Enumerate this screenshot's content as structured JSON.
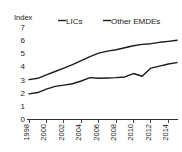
{
  "chart_data": {
    "type": "line",
    "title": "",
    "subtitle": "",
    "unit_label": "Index",
    "xlabel": "",
    "ylabel": "",
    "ylim": [
      0,
      7
    ],
    "yticks": [
      "0",
      "1",
      "2",
      "3",
      "4",
      "5",
      "6",
      "7"
    ],
    "ytick_values": [
      0,
      1,
      2,
      3,
      4,
      5,
      6,
      7
    ],
    "xlim": [
      1998,
      2015
    ],
    "xticks": [
      "1998",
      "2000",
      "2002",
      "2004",
      "2006",
      "2008",
      "2010",
      "2012",
      "2014"
    ],
    "xtick_values": [
      1998,
      2000,
      2002,
      2004,
      2006,
      2008,
      2010,
      2012,
      2014
    ],
    "x": [
      1998,
      1999,
      2000,
      2001,
      2002,
      2003,
      2004,
      2005,
      2006,
      2007,
      2008,
      2009,
      2010,
      2011,
      2012,
      2013,
      2014,
      2015
    ],
    "grid": false,
    "legend_position": "top",
    "series": [
      {
        "name": "LICs",
        "color": "#1a1a1a",
        "values": [
          1.85,
          1.95,
          2.2,
          2.4,
          2.5,
          2.6,
          2.8,
          3.05,
          3.0,
          3.02,
          3.05,
          3.1,
          3.35,
          3.15,
          3.75,
          3.9,
          4.05,
          4.15
        ]
      },
      {
        "name": "Other EMDEs",
        "color": "#1a1a1a",
        "values": [
          2.9,
          3.0,
          3.25,
          3.5,
          3.75,
          4.0,
          4.3,
          4.6,
          4.85,
          5.0,
          5.1,
          5.25,
          5.4,
          5.5,
          5.55,
          5.65,
          5.72,
          5.8
        ]
      }
    ],
    "annotations": []
  },
  "legend": {
    "items": [
      {
        "label": "LICs"
      },
      {
        "label": "Other EMDEs"
      }
    ]
  },
  "colors": {
    "background": "#ffffff",
    "ink": "#1a1a1a",
    "series_lics": "#1a1a1a",
    "series_other_emdes": "#1a1a1a"
  }
}
